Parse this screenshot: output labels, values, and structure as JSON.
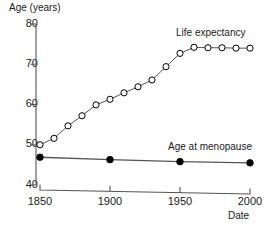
{
  "chart_data": {
    "type": "line",
    "title": "",
    "xlabel": "Date",
    "ylabel": "Age (years)",
    "xlim": [
      1850,
      2000
    ],
    "ylim": [
      40,
      80
    ],
    "xticks": [
      1850,
      1900,
      1950,
      2000
    ],
    "yticks": [
      40,
      50,
      60,
      70,
      80
    ],
    "xtick_labels": [
      "1850",
      "1900",
      "1950",
      "2000"
    ],
    "ytick_labels": [
      "40",
      "50",
      "60",
      "70",
      "80"
    ],
    "grid": false,
    "legend": "inline-annotations",
    "series": [
      {
        "name": "Life expectancy",
        "marker": "open-circle",
        "color": "#000000",
        "x": [
          1850,
          1860,
          1870,
          1880,
          1890,
          1900,
          1910,
          1920,
          1930,
          1940,
          1950,
          1960,
          1970,
          1980,
          1990,
          2000
        ],
        "values": [
          50.0,
          51.6,
          54.7,
          57.2,
          59.9,
          61.3,
          62.9,
          64.4,
          66.1,
          69.4,
          72.7,
          74.2,
          74.1,
          74.1,
          74.0,
          74.0
        ]
      },
      {
        "name": "Age at menopause",
        "marker": "filled-circle",
        "color": "#000000",
        "x": [
          1850,
          1900,
          1950,
          2000
        ],
        "values": [
          46.9,
          46.3,
          45.8,
          45.5
        ]
      }
    ],
    "annotations": [
      {
        "text": "Life expectancy",
        "near_series": "Life expectancy"
      },
      {
        "text": "Age at menopause",
        "near_series": "Age at menopause"
      }
    ]
  },
  "axis": {
    "y_title": "Age (years)",
    "x_title": "Date",
    "y_labels": [
      "80",
      "70",
      "60",
      "50",
      "40"
    ],
    "x_labels": [
      "1850",
      "1900",
      "1950",
      "2000"
    ]
  },
  "labels": {
    "life_expectancy": "Life expectancy",
    "age_at_menopause": "Age at menopause"
  },
  "colors": {
    "ink": "#000000",
    "line": "#555555",
    "background": "#ffffff"
  }
}
